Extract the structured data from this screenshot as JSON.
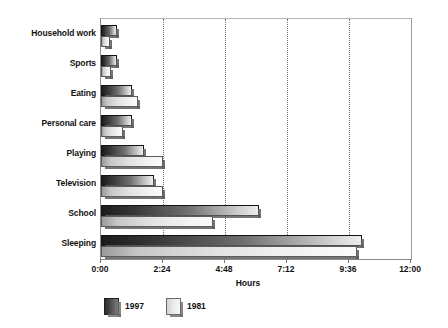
{
  "chart_data": {
    "type": "bar",
    "orientation": "horizontal",
    "title": "",
    "xlabel": "Hours",
    "ylabel": "",
    "categories": [
      "Household work",
      "Sports",
      "Eating",
      "Personal care",
      "Playing",
      "Television",
      "School",
      "Sleeping"
    ],
    "series": [
      {
        "name": "1997",
        "values": [
          0.6,
          0.6,
          1.2,
          1.2,
          1.65,
          2.05,
          6.1,
          10.1
        ]
      },
      {
        "name": "1981",
        "values": [
          0.35,
          0.4,
          1.45,
          0.85,
          2.4,
          2.4,
          4.35,
          9.9
        ]
      }
    ],
    "xlim": [
      0,
      12
    ],
    "xticks": [
      0,
      2.4,
      4.8,
      7.2,
      9.6,
      12
    ],
    "xtick_labels": [
      "0:00",
      "2:24",
      "4:48",
      "7:12",
      "9:36",
      "12:00"
    ],
    "grid": "vertical-dotted",
    "legend_position": "bottom-left",
    "colors": {
      "series_1997_dark": "#1b1b1b",
      "series_1997_light": "#ededed",
      "series_1981_dark": "#9a9a9a",
      "series_1981_light": "#fbfbfb",
      "gridline": "#6f6f6f",
      "axis": "#8a8a8a",
      "text": "#111111",
      "background": "#ffffff"
    }
  },
  "legend": {
    "items": [
      {
        "label": "1997",
        "swatch": "gradient-dark-swatch"
      },
      {
        "label": "1981",
        "swatch": "gradient-light-swatch"
      }
    ]
  }
}
